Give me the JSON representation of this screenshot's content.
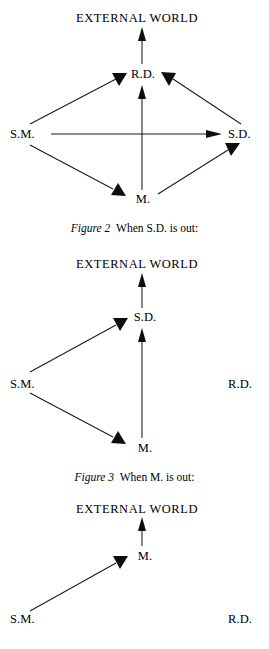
{
  "page": {
    "width": 269,
    "height": 649,
    "background": "#ffffff",
    "ink": "#000000"
  },
  "figures": [
    {
      "id": "figure-1",
      "caption_label": "",
      "caption_text": "",
      "heading": "EXTERNAL WORLD",
      "nodes": [
        {
          "id": "rd",
          "label": "R.D."
        },
        {
          "id": "sm",
          "label": "S.M."
        },
        {
          "id": "sd",
          "label": "S.D."
        },
        {
          "id": "m",
          "label": "M."
        }
      ],
      "edges": [
        {
          "from": "rd",
          "to": "external-world"
        },
        {
          "from": "sm",
          "to": "rd"
        },
        {
          "from": "sd",
          "to": "rd"
        },
        {
          "from": "m",
          "to": "rd"
        },
        {
          "from": "sm",
          "to": "sd"
        },
        {
          "from": "sm",
          "to": "m"
        },
        {
          "from": "m",
          "to": "sd"
        }
      ]
    },
    {
      "id": "figure-2",
      "caption_label": "Figure 2",
      "caption_text": "When S.D. is out:",
      "heading": "EXTERNAL WORLD",
      "nodes": [
        {
          "id": "sd",
          "label": "S.D."
        },
        {
          "id": "sm",
          "label": "S.M."
        },
        {
          "id": "rd",
          "label": "R.D."
        },
        {
          "id": "m",
          "label": "M."
        }
      ],
      "edges": [
        {
          "from": "sd",
          "to": "external-world"
        },
        {
          "from": "sm",
          "to": "sd"
        },
        {
          "from": "m",
          "to": "sd"
        },
        {
          "from": "sm",
          "to": "m"
        }
      ]
    },
    {
      "id": "figure-3",
      "caption_label": "Figure 3",
      "caption_text": "When M. is out:",
      "heading": "EXTERNAL WORLD",
      "nodes": [
        {
          "id": "m",
          "label": "M."
        },
        {
          "id": "sm",
          "label": "S.M."
        },
        {
          "id": "rd",
          "label": "R.D."
        }
      ],
      "edges": [
        {
          "from": "m",
          "to": "external-world"
        },
        {
          "from": "sm",
          "to": "m"
        }
      ]
    }
  ]
}
